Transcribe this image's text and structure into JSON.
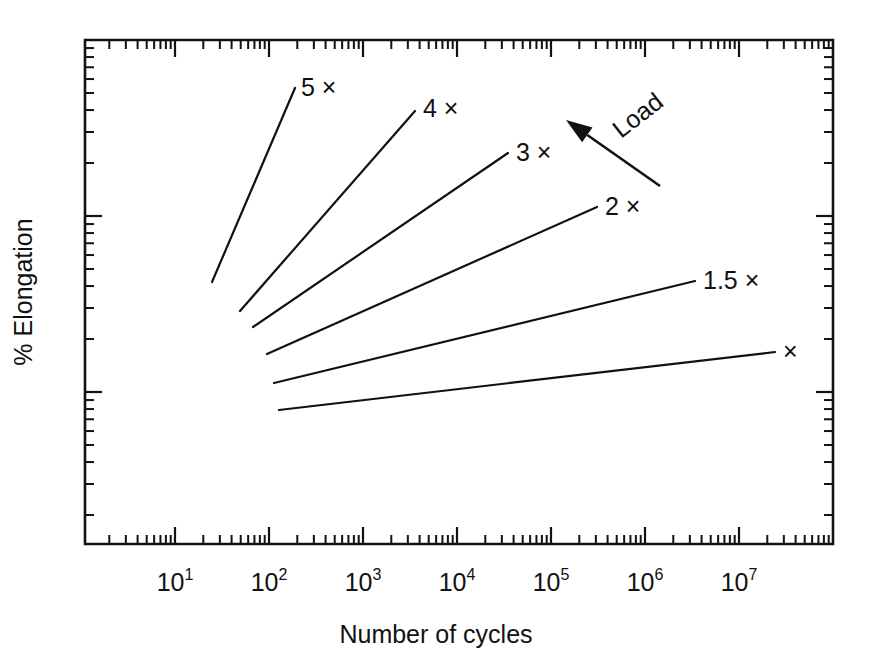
{
  "figure": {
    "background_color": "#ffffff",
    "ink_color": "#111111",
    "width": 872,
    "height": 662
  },
  "axes": {
    "x_title": "Number of cycles",
    "y_title": "% Elongation",
    "x_tick_labels": [
      {
        "base": "10",
        "exponent": "1"
      },
      {
        "base": "10",
        "exponent": "2"
      },
      {
        "base": "10",
        "exponent": "3"
      },
      {
        "base": "10",
        "exponent": "4"
      },
      {
        "base": "10",
        "exponent": "5"
      },
      {
        "base": "10",
        "exponent": "6"
      },
      {
        "base": "10",
        "exponent": "7"
      }
    ],
    "y_tick_labels": []
  },
  "annotations": {
    "load_arrow_label": "Load"
  },
  "chart_data": {
    "type": "line",
    "title": "",
    "subtitle": "",
    "xlabel": "Number of cycles",
    "ylabel": "% Elongation",
    "xscale": "log",
    "yscale": "log",
    "xlim": [
      1.26,
      100000000
    ],
    "ylim": [
      1,
      40
    ],
    "x_ticks": [
      10,
      100,
      1000,
      10000,
      100000,
      1000000,
      10000000
    ],
    "x_tick_labels": [
      "10^1",
      "10^2",
      "10^3",
      "10^4",
      "10^5",
      "10^6",
      "10^7"
    ],
    "y_ticks": [],
    "y_tick_labels": [],
    "grid": false,
    "legend": "inline-end-labels",
    "annotations": [
      {
        "text": "Load",
        "type": "arrow",
        "meaning": "Load increases in the direction of the arrow (up and to the left)",
        "rotation_deg": -38
      }
    ],
    "series": [
      {
        "name": "5 ×",
        "label": "5 ×",
        "points": [
          {
            "x": 27,
            "y": 2.38
          },
          {
            "x": 340,
            "y": 9.28
          }
        ]
      },
      {
        "name": "4 ×",
        "label": "4 ×",
        "points": [
          {
            "x": 57,
            "y": 2.05
          },
          {
            "x": 8100,
            "y": 7.29
          }
        ]
      },
      {
        "name": "3 ×",
        "label": "3 ×",
        "points": [
          {
            "x": 78,
            "y": 1.9
          },
          {
            "x": 95000,
            "y": 5.92
          }
        ]
      },
      {
        "name": "2 ×",
        "label": "2 ×",
        "points": [
          {
            "x": 110,
            "y": 1.65
          },
          {
            "x": 1150000,
            "y": 4.71
          }
        ]
      },
      {
        "name": "1.5 ×",
        "label": "1.5 ×",
        "points": [
          {
            "x": 135,
            "y": 1.45
          },
          {
            "x": 14000000,
            "y": 3.55
          }
        ]
      },
      {
        "name": "×",
        "label": "×",
        "points": [
          {
            "x": 148,
            "y": 1.3
          },
          {
            "x": 52000000,
            "y": 2.68
          }
        ]
      }
    ]
  },
  "geometry": {
    "plot": {
      "left": 85,
      "right": 833,
      "top": 40,
      "bottom": 544
    },
    "x_decade_px": 94,
    "x_origin_decade_px": 175,
    "lines": [
      {
        "name": "5x",
        "x1": 212,
        "y1": 282,
        "x2": 295,
        "y2": 88,
        "label_x": 301,
        "label_y": 96
      },
      {
        "name": "4x",
        "x1": 240,
        "y1": 311,
        "x2": 415,
        "y2": 111,
        "label_x": 423,
        "label_y": 117
      },
      {
        "name": "3x",
        "x1": 253,
        "y1": 327,
        "x2": 508,
        "y2": 153,
        "label_x": 516,
        "label_y": 161
      },
      {
        "name": "2x",
        "x1": 267,
        "y1": 354,
        "x2": 597,
        "y2": 207,
        "label_x": 605,
        "label_y": 215
      },
      {
        "name": "1.5x",
        "x1": 274,
        "y1": 383,
        "x2": 695,
        "y2": 281,
        "label_x": 703,
        "label_y": 289
      },
      {
        "name": "1x",
        "x1": 279,
        "y1": 410,
        "x2": 775,
        "y2": 352,
        "label_x": 783,
        "label_y": 360
      }
    ],
    "arrow": {
      "x1": 660,
      "y1": 186,
      "x2": 566,
      "y2": 120,
      "label_x": 643,
      "label_y": 122
    }
  }
}
